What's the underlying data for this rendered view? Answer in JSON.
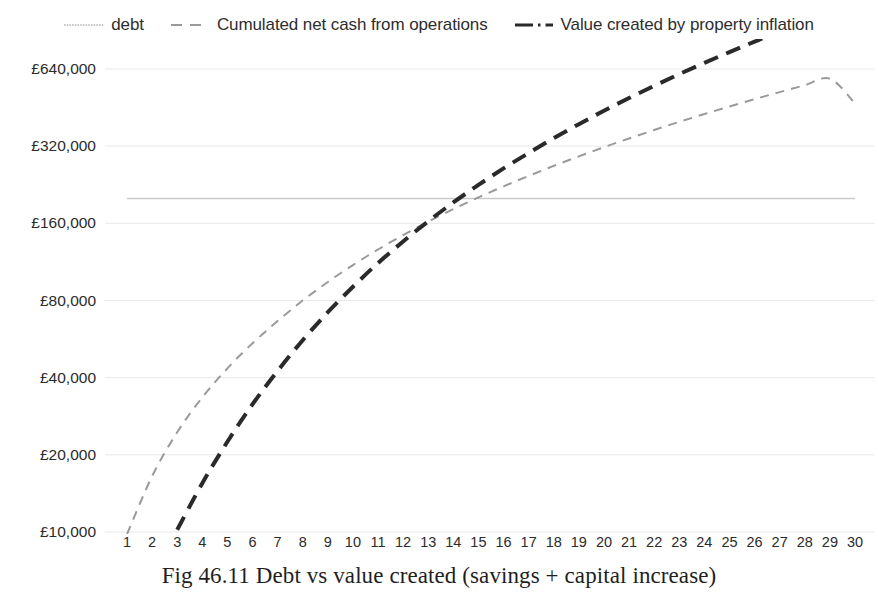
{
  "chart_data": {
    "type": "line",
    "title": "Fig 46.11 Debt vs value created (savings + capital increase)",
    "xlabel": "",
    "ylabel": "",
    "yscale": "log2",
    "ylim": [
      10000,
      640000
    ],
    "xlim": [
      1,
      30
    ],
    "grid": true,
    "legend_position": "top-center",
    "ytick_labels": [
      "£640,000",
      "£320,000",
      "£160,000",
      "£80,000",
      "£40,000",
      "£20,000",
      "£10,000"
    ],
    "ytick_values": [
      640000,
      320000,
      160000,
      80000,
      40000,
      20000,
      10000
    ],
    "xtick_labels": [
      "1",
      "2",
      "3",
      "4",
      "5",
      "6",
      "7",
      "8",
      "9",
      "10",
      "11",
      "12",
      "13",
      "14",
      "15",
      "16",
      "17",
      "18",
      "19",
      "20",
      "21",
      "22",
      "23",
      "24",
      "25",
      "26",
      "27",
      "28",
      "29",
      "30"
    ],
    "x": [
      1,
      2,
      3,
      4,
      5,
      6,
      7,
      8,
      9,
      10,
      11,
      12,
      13,
      14,
      15,
      16,
      17,
      18,
      19,
      20,
      21,
      22,
      23,
      24,
      25,
      26,
      27,
      28,
      29,
      30
    ],
    "series": [
      {
        "name": "debt",
        "style": "solid-thin",
        "color": "#c9c9c9",
        "values": [
          200000,
          200000,
          200000,
          200000,
          200000,
          200000,
          200000,
          200000,
          200000,
          200000,
          200000,
          200000,
          200000,
          200000,
          200000,
          200000,
          200000,
          200000,
          200000,
          200000,
          200000,
          200000,
          200000,
          200000,
          200000,
          200000,
          200000,
          200000,
          200000,
          200000
        ]
      },
      {
        "name": "Cumulated net cash from operations",
        "style": "dashed-thin",
        "color": "#9a9a9a",
        "values": [
          9800,
          16500,
          24500,
          33500,
          43500,
          54500,
          66500,
          80000,
          94500,
          110000,
          126500,
          144000,
          162500,
          182000,
          202000,
          223000,
          245000,
          268000,
          292000,
          317000,
          343000,
          370000,
          398000,
          427000,
          457000,
          488000,
          520000,
          553000,
          587000,
          470000
        ]
      },
      {
        "name": "Value created by property inflation",
        "style": "dashed-thick",
        "color": "#2a2a2a",
        "values": [
          3100,
          6400,
          10200,
          15500,
          22500,
          31500,
          42500,
          56000,
          72000,
          90500,
          112000,
          136000,
          163000,
          193000,
          226000,
          262000,
          301000,
          344000,
          390000,
          440000,
          493000,
          550000,
          611000,
          676000,
          745000,
          818000,
          895000,
          976000,
          1061000,
          1150000
        ]
      }
    ],
    "annotations": []
  },
  "legend": {
    "items": [
      {
        "label": "debt",
        "marker": "thin-dotted-line-marker",
        "color": "#c4c4c4"
      },
      {
        "label": "Cumulated net cash from operations",
        "marker": "dashed-line-marker",
        "color": "#9a9a9a"
      },
      {
        "label": "Value created by property inflation",
        "marker": "thick-dash-dot-line-marker",
        "color": "#2a2a2a"
      }
    ]
  },
  "caption": {
    "text": "Fig 46.11 Debt vs value created (savings + capital increase)"
  },
  "colors": {
    "gridline": "#e8e8e8",
    "debt_line": "#c9c9c9",
    "cash_line": "#9a9a9a",
    "value_line": "#2a2a2a",
    "text": "#2b2b2b",
    "background": "#ffffff"
  }
}
